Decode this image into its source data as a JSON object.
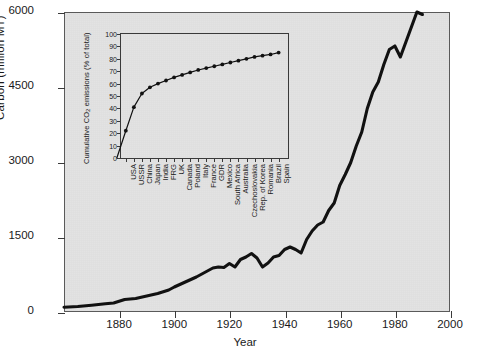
{
  "chart_data": [
    {
      "type": "line",
      "id": "main-carbon-emissions",
      "title": "",
      "xlabel": "Year",
      "ylabel": "Carbon (million MT)",
      "xlim": [
        1860,
        2000
      ],
      "ylim": [
        0,
        6000
      ],
      "xticks": [
        1880,
        1900,
        1920,
        1940,
        1960,
        1980,
        2000
      ],
      "xticklabels": [
        "1880",
        "1900",
        "1920",
        "1940",
        "1960",
        "1980",
        "2000"
      ],
      "yticks": [
        0,
        1500,
        3000,
        4500,
        6000
      ],
      "yticklabels": [
        "0",
        "1500",
        "3000",
        "4500",
        "6000"
      ],
      "grid": false,
      "legend": "none",
      "series": [
        {
          "name": "Global carbon emissions",
          "x": [
            1860,
            1865,
            1870,
            1875,
            1878,
            1882,
            1886,
            1890,
            1894,
            1898,
            1900,
            1904,
            1908,
            1912,
            1914,
            1916,
            1918,
            1920,
            1922,
            1924,
            1926,
            1928,
            1930,
            1932,
            1934,
            1936,
            1938,
            1940,
            1942,
            1944,
            1946,
            1948,
            1950,
            1952,
            1954,
            1956,
            1958,
            1960,
            1962,
            1964,
            1966,
            1968,
            1970,
            1972,
            1974,
            1976,
            1978,
            1980,
            1982,
            1984,
            1986,
            1988,
            1990
          ],
          "y": [
            95,
            110,
            135,
            165,
            180,
            250,
            270,
            320,
            370,
            440,
            500,
            600,
            700,
            820,
            880,
            900,
            890,
            970,
            900,
            1050,
            1100,
            1170,
            1080,
            900,
            980,
            1100,
            1130,
            1250,
            1300,
            1250,
            1180,
            1450,
            1620,
            1740,
            1800,
            2030,
            2180,
            2530,
            2750,
            2990,
            3320,
            3600,
            4070,
            4400,
            4600,
            4950,
            5250,
            5320,
            5100,
            5400,
            5700,
            6000,
            5950
          ]
        }
      ]
    },
    {
      "type": "line",
      "id": "inset-cumulative-co2",
      "title": "",
      "xlabel": "",
      "ylabel": "Cumulative CO2 emissions (% of total)",
      "ylabel_rich": "Cumulative CO₂ emissions (% of total)",
      "ylim": [
        0,
        100
      ],
      "yticks": [
        0,
        10,
        20,
        30,
        40,
        50,
        60,
        70,
        80,
        90,
        100
      ],
      "yticklabels": [
        "0",
        "10",
        "20",
        "30",
        "40",
        "50",
        "60",
        "70",
        "80",
        "90",
        "100"
      ],
      "grid": false,
      "legend": "none",
      "marker": "filled-circle",
      "categories": [
        "USA",
        "USSR",
        "China",
        "Japan",
        "India",
        "FRG",
        "UK",
        "Canada",
        "Poland",
        "Italy",
        "France",
        "GDR",
        "Mexico",
        "South Africa",
        "Australia",
        "Czechoslovakia",
        "Rep. of Korea",
        "Romania",
        "Brazil",
        "Spain"
      ],
      "values": [
        22,
        41,
        52,
        57,
        60,
        62.5,
        65,
        67,
        69,
        71,
        72.5,
        74,
        75.5,
        77,
        78.5,
        80,
        81.5,
        82.5,
        83.5,
        85
      ]
    }
  ],
  "main": {
    "y_axis_title": "Carbon (million MT)",
    "x_axis_title": "Year"
  },
  "inset": {
    "y_axis_title_prefix": "Cumulative CO",
    "y_axis_title_sub": "2",
    "y_axis_title_suffix": " emissions (% of total)"
  },
  "colors": {
    "plot_background": "#e3e3e3",
    "page_background": "#ffffff",
    "line": "#111111",
    "axis": "#3a3a3a",
    "text": "#1a1a1a"
  }
}
